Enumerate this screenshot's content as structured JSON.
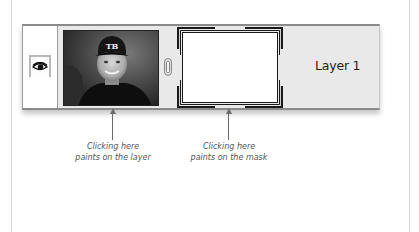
{
  "layer": {
    "name": "Layer 1",
    "visibility_icon": "eye-icon",
    "link_icon": "chain-link-icon",
    "layer_thumbnail": "photo of smiling boy wearing a TB baseball cap",
    "cap_text": "TB",
    "mask_thumbnail": "white layer mask (selected)"
  },
  "annotations": [
    {
      "line1": "Clicking here",
      "line2": "paints on the layer"
    },
    {
      "line1": "Clicking here",
      "line2": "paints on the mask"
    }
  ],
  "colors": {
    "strip_background": "#e9e9e9",
    "strip_border": "#8a8a8a",
    "mask_bracket": "#1a1a1a",
    "caption_text": "#555555"
  }
}
